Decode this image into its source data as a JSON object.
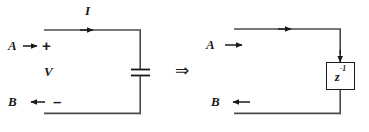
{
  "figure": {
    "background_color": "#ffffff",
    "stroke_color": "#4a4a4a",
    "text_color": "#1a1a1a"
  },
  "left_circuit": {
    "name": "capacitor-circuit",
    "current_label": "I",
    "voltage_label": "V",
    "terminal_top_label": "A",
    "terminal_top_sign": "+",
    "terminal_bottom_label": "B",
    "terminal_bottom_sign": "–",
    "element": "capacitor"
  },
  "operator": {
    "symbol": "⇒",
    "name": "implies"
  },
  "right_circuit": {
    "name": "delay-block-diagram",
    "terminal_top_label": "A",
    "terminal_bottom_label": "B",
    "block_label_base": "z",
    "block_label_exponent": "-1"
  }
}
